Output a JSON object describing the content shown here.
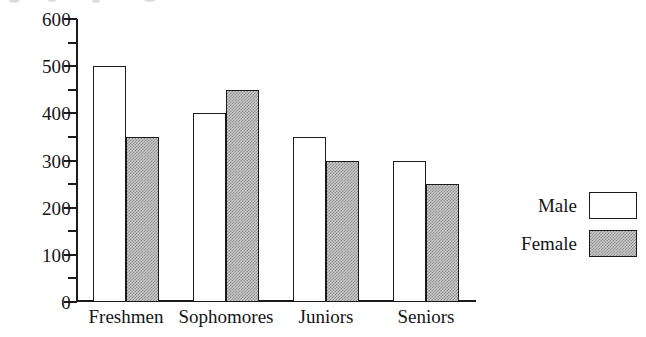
{
  "chart_data": {
    "type": "bar",
    "title": "",
    "subtitle": "",
    "xlabel": "",
    "ylabel": "",
    "categories": [
      "Freshmen",
      "Sophomores",
      "Juniors",
      "Seniors"
    ],
    "series": [
      {
        "name": "Male",
        "values": [
          500,
          400,
          350,
          300
        ]
      },
      {
        "name": "Female",
        "values": [
          350,
          450,
          300,
          250
        ]
      }
    ],
    "ylim": [
      0,
      600
    ],
    "ytick_labels": [
      "0",
      "100",
      "200",
      "300",
      "400",
      "500",
      "600"
    ],
    "ytick_values": [
      0,
      100,
      200,
      300,
      400,
      500,
      600
    ],
    "yminor_values": [
      50,
      150,
      250,
      350,
      450,
      550
    ],
    "grid": false,
    "legend_position": "right",
    "legend": [
      {
        "label": "Male",
        "swatch": "white"
      },
      {
        "label": "Female",
        "swatch": "gray-hatched"
      }
    ],
    "colors": {
      "male_fill": "#ffffff",
      "female_fill": "#c9c9c9",
      "outline": "#1b1b1b",
      "background": "#ffffff",
      "text": "#151515"
    }
  }
}
